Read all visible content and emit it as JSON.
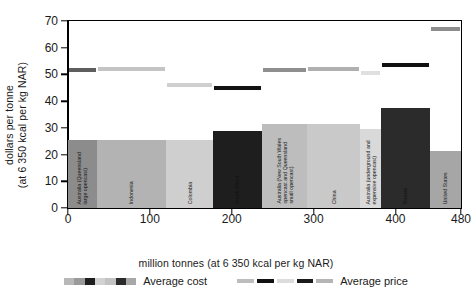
{
  "chart_data": {
    "type": "bar",
    "title": "",
    "xlabel": "million tonnes (at 6 350 kcal per kg NAR)",
    "ylabel": "dollars per tonne\n(at 6 350 kcal per kg NAR)",
    "xlim": [
      0,
      480
    ],
    "ylim": [
      0,
      70
    ],
    "xticks": [
      0,
      100,
      200,
      300,
      400,
      480
    ],
    "yticks": [
      0,
      10,
      20,
      30,
      40,
      50,
      60,
      70
    ],
    "grid": false,
    "legend_position": "bottom",
    "value_unit": "dollars per tonne",
    "width_unit": "million tonnes",
    "series": [
      {
        "name": "Average cost",
        "type": "variable-width-bar",
        "values": [
          25.5,
          25.5,
          25.5,
          29.0,
          31.5,
          31.5,
          29.5,
          37.5,
          21.5
        ],
        "widths": [
          35,
          85,
          57,
          60,
          55,
          65,
          25,
          60,
          38
        ]
      },
      {
        "name": "Average price",
        "type": "step-line",
        "values": [
          51.5,
          52.0,
          46.0,
          45.0,
          51.5,
          52.0,
          50.5,
          53.5,
          67.0
        ]
      }
    ],
    "bars": [
      {
        "label": "Australia (Queensland\nlarge opencast)",
        "x_start": 0,
        "x_end": 35,
        "cost": 25.5,
        "price": 51.5,
        "fill": "#8c8c8c",
        "price_color": "#5e5e5e"
      },
      {
        "label": "Indonesia",
        "x_start": 35,
        "x_end": 120,
        "cost": 25.5,
        "price": 52.0,
        "fill": "#b3b3b3",
        "price_color": "#c4c4c4"
      },
      {
        "label": "Colombia",
        "x_start": 120,
        "x_end": 177,
        "cost": 25.5,
        "price": 46.0,
        "fill": "#cfcfcf",
        "price_color": "#cfcfcf"
      },
      {
        "label": "South Africa",
        "x_start": 177,
        "x_end": 237,
        "cost": 29.0,
        "price": 45.0,
        "fill": "#1e1e1e",
        "price_color": "#121212"
      },
      {
        "label": "Australia (New South Wales\nopencast and Queensland\nsmall opencast)",
        "x_start": 237,
        "x_end": 292,
        "cost": 31.5,
        "price": 51.5,
        "fill": "#bdbdbd",
        "price_color": "#8f8f8f"
      },
      {
        "label": "China",
        "x_start": 292,
        "x_end": 357,
        "cost": 31.5,
        "price": 52.0,
        "fill": "#c9c9c9",
        "price_color": "#b0b0b0"
      },
      {
        "label": "Australia (underground and\nexpensive opencast)",
        "x_start": 357,
        "x_end": 382,
        "cost": 29.5,
        "price": 50.5,
        "fill": "#d9d9d9",
        "price_color": "#e0e0e0"
      },
      {
        "label": "Russia",
        "x_start": 382,
        "x_end": 442,
        "cost": 37.5,
        "price": 53.5,
        "fill": "#2b2b2b",
        "price_color": "#111111"
      },
      {
        "label": "United States",
        "x_start": 442,
        "x_end": 480,
        "cost": 21.5,
        "price": 67.0,
        "fill": "#a6a6a6",
        "price_color": "#8d8d8d"
      }
    ],
    "legend": [
      {
        "label": "Average cost",
        "kind": "swatches"
      },
      {
        "label": "Average price",
        "kind": "lines"
      }
    ]
  }
}
